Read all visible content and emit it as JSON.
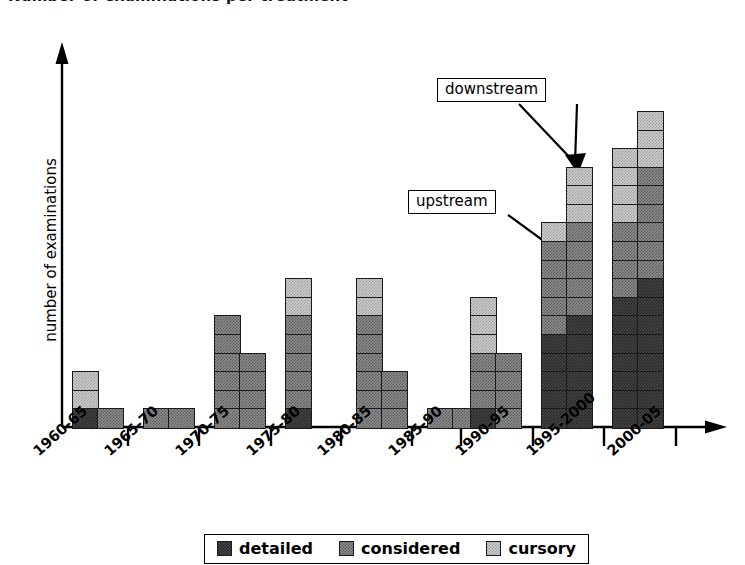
{
  "chart_data": {
    "type": "bar",
    "title": "Number of examinations per treatment",
    "subtitle": "",
    "xlabel": "",
    "ylabel": "number of examinations",
    "grid": false,
    "legend_position": "bottom",
    "stacked": true,
    "grouped_pairs": true,
    "ylim": [
      0,
      18
    ],
    "categories": [
      "1960-65",
      "1965-70",
      "1970-75",
      "1975-80",
      "1980-85",
      "1985-90",
      "1990-95",
      "1995-2000",
      "2000-05"
    ],
    "group_labels": [
      "upstream",
      "downstream"
    ],
    "legend_entries": [
      {
        "label": "detailed",
        "color": "#454545"
      },
      {
        "label": "considered",
        "color": "#8c8c8c"
      },
      {
        "label": "cursory",
        "color": "#cbcbcb"
      }
    ],
    "series": [
      {
        "name": "detailed",
        "upstream": [
          1,
          0,
          0,
          0,
          0,
          0,
          1,
          5,
          7
        ],
        "downstream": [
          0,
          0,
          0,
          1,
          0,
          0,
          0,
          6,
          8
        ]
      },
      {
        "name": "considered",
        "upstream": [
          0,
          1,
          6,
          5,
          6,
          0,
          3,
          5,
          4
        ],
        "downstream": [
          1,
          1,
          4,
          0,
          3,
          1,
          4,
          5,
          6
        ]
      },
      {
        "name": "cursory",
        "upstream": [
          2,
          0,
          0,
          2,
          2,
          0,
          3,
          1,
          4
        ],
        "downstream": [
          0,
          0,
          0,
          0,
          0,
          0,
          0,
          3,
          3
        ]
      }
    ],
    "totals": {
      "upstream": [
        3,
        1,
        6,
        7,
        8,
        0,
        7,
        11,
        15
      ],
      "downstream": [
        1,
        1,
        4,
        1,
        3,
        1,
        4,
        14,
        17
      ]
    },
    "annotations": [
      {
        "text": "downstream",
        "target": "1995-2000 downstream bar top"
      },
      {
        "text": "upstream",
        "target": "1995-2000 upstream bar top"
      }
    ]
  },
  "bars": [
    {
      "category": "1960-65",
      "upstream": [
        {
          "class": "detailed",
          "n": 1
        },
        {
          "class": "cursory",
          "n": 2
        }
      ],
      "downstream": [
        {
          "class": "considered",
          "n": 1
        }
      ]
    },
    {
      "category": "1965-70",
      "upstream": [
        {
          "class": "considered",
          "n": 1
        }
      ],
      "downstream": [
        {
          "class": "considered",
          "n": 1
        }
      ]
    },
    {
      "category": "1970-75",
      "upstream": [
        {
          "class": "considered",
          "n": 6
        }
      ],
      "downstream": [
        {
          "class": "considered",
          "n": 4
        }
      ]
    },
    {
      "category": "1975-80",
      "upstream": [
        {
          "class": "detailed",
          "n": 1
        },
        {
          "class": "considered",
          "n": 5
        },
        {
          "class": "cursory",
          "n": 2
        }
      ],
      "downstream": []
    },
    {
      "category": "1980-85",
      "upstream": [
        {
          "class": "considered",
          "n": 6
        },
        {
          "class": "cursory",
          "n": 2
        }
      ],
      "downstream": [
        {
          "class": "considered",
          "n": 3
        }
      ]
    },
    {
      "category": "1985-90",
      "upstream": [
        {
          "class": "considered",
          "n": 1
        }
      ],
      "downstream": [
        {
          "class": "considered",
          "n": 1
        }
      ]
    },
    {
      "category": "1990-95",
      "upstream": [
        {
          "class": "detailed",
          "n": 1
        },
        {
          "class": "considered",
          "n": 3
        },
        {
          "class": "cursory",
          "n": 3
        }
      ],
      "downstream": [
        {
          "class": "considered",
          "n": 4
        }
      ]
    },
    {
      "category": "1995-2000",
      "upstream": [
        {
          "class": "detailed",
          "n": 5
        },
        {
          "class": "considered",
          "n": 5
        },
        {
          "class": "cursory",
          "n": 1
        }
      ],
      "downstream": [
        {
          "class": "detailed",
          "n": 6
        },
        {
          "class": "considered",
          "n": 5
        },
        {
          "class": "cursory",
          "n": 3
        }
      ]
    },
    {
      "category": "2000-05",
      "upstream": [
        {
          "class": "detailed",
          "n": 7
        },
        {
          "class": "considered",
          "n": 4
        },
        {
          "class": "cursory",
          "n": 4
        }
      ],
      "downstream": [
        {
          "class": "detailed",
          "n": 8
        },
        {
          "class": "considered",
          "n": 6
        },
        {
          "class": "cursory",
          "n": 3
        }
      ]
    }
  ],
  "annotations": {
    "downstream_label": "downstream",
    "upstream_label": "upstream"
  },
  "axis": {
    "y_label": "number of examinations"
  },
  "legend": {
    "items": [
      {
        "label": "detailed",
        "swatch": "detailed"
      },
      {
        "label": "considered",
        "swatch": "considered"
      },
      {
        "label": "cursory",
        "swatch": "cursory"
      }
    ]
  }
}
